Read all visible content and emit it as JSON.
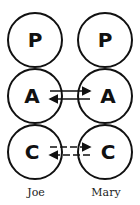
{
  "diagram": {
    "type": "transactional-analysis-ego-states",
    "people": [
      {
        "name": "Joe",
        "states": [
          {
            "letter": "P"
          },
          {
            "letter": "A"
          },
          {
            "letter": "C"
          }
        ]
      },
      {
        "name": "Mary",
        "states": [
          {
            "letter": "P"
          },
          {
            "letter": "A"
          },
          {
            "letter": "C"
          }
        ]
      }
    ],
    "transactions": [
      {
        "from": "Joe.A",
        "to": "Mary.A",
        "style": "solid"
      },
      {
        "from": "Mary.A",
        "to": "Joe.A",
        "style": "solid"
      },
      {
        "from": "Joe.C",
        "to": "Mary.C",
        "style": "dashed"
      },
      {
        "from": "Mary.C",
        "to": "Joe.C",
        "style": "dashed"
      }
    ],
    "colors": {
      "stroke": "#111111",
      "background": "#ffffff"
    }
  }
}
